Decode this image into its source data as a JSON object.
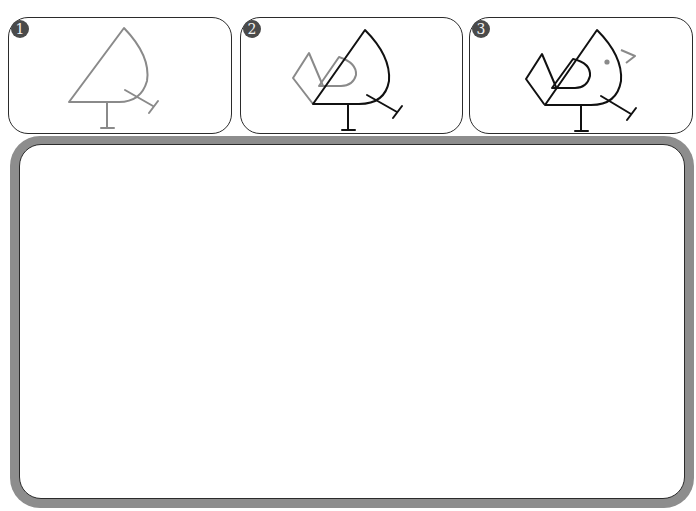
{
  "steps": [
    {
      "number": "1",
      "description": "Draw the body outline, tail line, and two legs",
      "stroke_color": "#8a8a8a"
    },
    {
      "number": "2",
      "description": "Darken the body and add the wing and tail feathers",
      "stroke_color": "#111111",
      "new_stroke_color": "#8a8a8a"
    },
    {
      "number": "3",
      "description": "Add the eye and beak",
      "stroke_color": "#111111",
      "new_stroke_color": "#8a8a8a"
    }
  ],
  "colors": {
    "badge": "#4a4a4a",
    "frame": "#8d8d8d",
    "outline": "#2b2b2b",
    "guide_gray": "#8a8a8a",
    "ink": "#111111"
  },
  "canvas": {
    "label": "Drawing area"
  }
}
